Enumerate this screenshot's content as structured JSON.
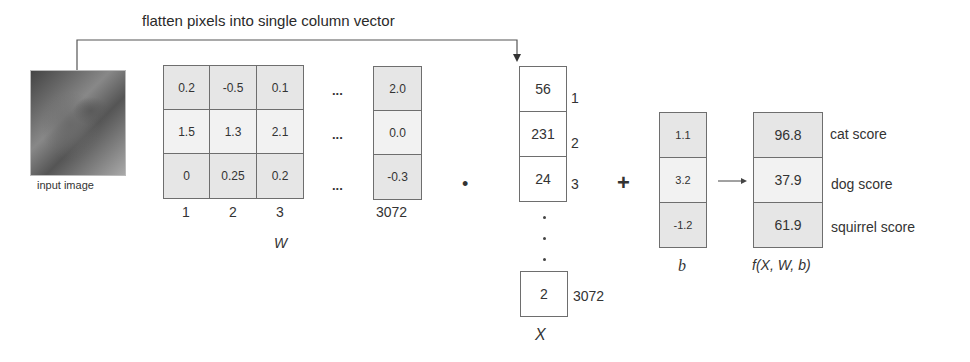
{
  "title": "flatten pixels into single column vector",
  "input_image": {
    "label": "input image",
    "icon": "cat-photo"
  },
  "weights": {
    "symbol": "W",
    "rows": [
      [
        "0.2",
        "-0.5",
        "0.1"
      ],
      [
        "1.5",
        "1.3",
        "2.1"
      ],
      [
        "0",
        "0.25",
        "0.2"
      ]
    ],
    "last_column": [
      "2.0",
      "0.0",
      "-0.3"
    ],
    "column_indices": [
      "1",
      "2",
      "3"
    ],
    "last_column_index": "3072",
    "ellipsis": "..."
  },
  "dot_operator": "•",
  "pixels": {
    "symbol": "X",
    "values": [
      "56",
      "231",
      "24"
    ],
    "indices": [
      "1",
      "2",
      "3"
    ],
    "last_value": "2",
    "last_index": "3072"
  },
  "plus_operator": "+",
  "bias": {
    "symbol": "b",
    "values": [
      "1.1",
      "3.2",
      "-1.2"
    ]
  },
  "output": {
    "symbol": "f(X, W, b)",
    "values": [
      "96.8",
      "37.9",
      "61.9"
    ],
    "labels": [
      "cat score",
      "dog score",
      "squirrel score"
    ]
  }
}
